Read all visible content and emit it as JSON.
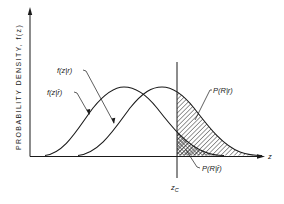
{
  "figure": {
    "y_axis_label": "PROBABILITY DENSITY, f(z)",
    "x_axis_label": "z",
    "threshold_label": "z",
    "threshold_subscript": "C",
    "curves": [
      {
        "id": "noise",
        "label": "f(z|r̄)",
        "peak_x": 124,
        "description": "density when target absent"
      },
      {
        "id": "signal",
        "label": "f(z|r)",
        "peak_x": 162,
        "description": "density when target present"
      }
    ],
    "regions": [
      {
        "id": "detection",
        "label": "P(R|r)",
        "fill": "diagonal-hatch"
      },
      {
        "id": "false-alarm",
        "label": "P(R|r̄)",
        "fill": "cross-hatch"
      }
    ],
    "colors": {
      "ink": "#1a1a1a",
      "background": "#ffffff"
    }
  }
}
